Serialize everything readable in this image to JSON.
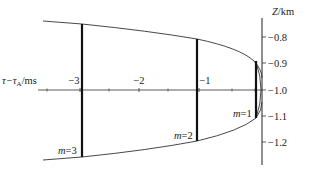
{
  "diagram": {
    "colors": {
      "line": "#333333",
      "bold": "#111111",
      "text": "#222222",
      "background": "#ffffff"
    },
    "z_axis": {
      "label": "Z/km",
      "x": 262,
      "y_top": 18,
      "y_bottom": 165,
      "ticks": [
        {
          "value": "−0.8",
          "y": 37
        },
        {
          "value": "−0.9",
          "y": 63
        },
        {
          "value": "−1.0",
          "y": 90
        },
        {
          "value": "−1.1",
          "y": 116
        },
        {
          "value": "−1.2",
          "y": 142
        }
      ]
    },
    "tau_axis": {
      "label": "τ−τ",
      "label_sub": "A",
      "label_unit": "/ms",
      "y": 90,
      "x_left": 38,
      "x_right": 262,
      "major_ticks": [
        {
          "value": "−3",
          "x": 80,
          "label_x": 74
        },
        {
          "value": "−2",
          "x": 139,
          "label_x": 139
        },
        {
          "value": "−1",
          "x": 199,
          "label_x": 205
        }
      ],
      "minor_tick_xs": [
        47,
        109,
        168,
        232,
        255
      ]
    },
    "envelope": {
      "upper_path": "M 43 21 L 82 24 Q 150 31 197 39 Q 240 48 254 61 Q 262 70 262 78",
      "lower_path": "M 43 160 L 82 157 Q 150 150 197 141 Q 240 131 256 118 Q 262 110 262 102",
      "inner_arc_path": "M 256 62 Q 266 90 256 118"
    },
    "modes": [
      {
        "label": "m=3",
        "m_var": "m",
        "m_value": "=3",
        "x": 82,
        "y_top": 24,
        "y_bottom": 157,
        "label_x": 58,
        "label_y": 154
      },
      {
        "label": "m=2",
        "m_var": "m",
        "m_value": "=2",
        "x": 197,
        "y_top": 39,
        "y_bottom": 141,
        "label_x": 174,
        "label_y": 139
      },
      {
        "label": "m=1",
        "m_var": "m",
        "m_value": "=1",
        "x": 256,
        "y_top": 61,
        "y_bottom": 118,
        "label_x": 233,
        "label_y": 117
      }
    ]
  }
}
